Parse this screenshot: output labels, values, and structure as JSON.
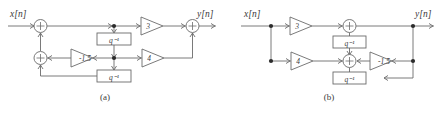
{
  "figure": {
    "panels": [
      {
        "id": "a",
        "caption": "(a)",
        "input_label": "x[n]",
        "output_label": "y[n]",
        "gains": [
          {
            "name": "gain-3",
            "value": "3",
            "direction": "right"
          },
          {
            "name": "gain-neg-1-5",
            "value": "-1.5",
            "direction": "left"
          },
          {
            "name": "gain-4",
            "value": "4",
            "direction": "right"
          }
        ],
        "delays": [
          {
            "name": "delay-top",
            "value": "q⁻¹"
          },
          {
            "name": "delay-bottom",
            "value": "q⁻¹"
          }
        ],
        "adders": [
          {
            "name": "adder-input",
            "symbol": "+"
          },
          {
            "name": "adder-feedback",
            "symbol": "+"
          },
          {
            "name": "adder-output",
            "symbol": "+"
          }
        ]
      },
      {
        "id": "b",
        "caption": "(b)",
        "input_label": "x[n]",
        "output_label": "y[n]",
        "gains": [
          {
            "name": "gain-3",
            "value": "3",
            "direction": "right"
          },
          {
            "name": "gain-4",
            "value": "4",
            "direction": "right"
          },
          {
            "name": "gain-neg-1-5",
            "value": "-1.5",
            "direction": "left"
          }
        ],
        "delays": [
          {
            "name": "delay-top",
            "value": "q⁻¹"
          },
          {
            "name": "delay-bottom",
            "value": "q⁻¹"
          }
        ],
        "adders": [
          {
            "name": "adder-top",
            "symbol": "+"
          },
          {
            "name": "adder-bottom",
            "symbol": "+"
          }
        ]
      }
    ]
  },
  "colors": {
    "wire": "#6b6b6b",
    "text": "#3a3a3a",
    "node": "#2b2b2b",
    "background": "#ffffff"
  }
}
